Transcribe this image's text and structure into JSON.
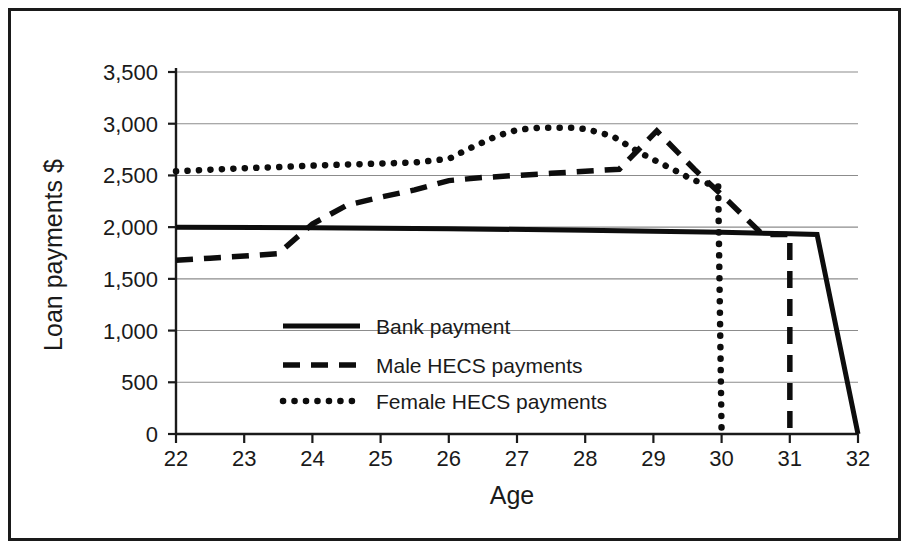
{
  "chart_data": {
    "type": "line",
    "title": "",
    "xlabel": "Age",
    "ylabel": "Loan payments $",
    "xlim": [
      22,
      32
    ],
    "ylim": [
      0,
      3500
    ],
    "ytick_labels": [
      "3,500",
      "3,000",
      "2,500",
      "2,000",
      "1,500",
      "1,000",
      "500",
      "0"
    ],
    "ytick_values": [
      3500,
      3000,
      2500,
      2000,
      1500,
      1000,
      500,
      0
    ],
    "xtick_labels": [
      "22",
      "23",
      "24",
      "25",
      "26",
      "27",
      "28",
      "29",
      "30",
      "31",
      "32"
    ],
    "xtick_values": [
      22,
      23,
      24,
      25,
      26,
      27,
      28,
      29,
      30,
      31,
      32
    ],
    "grid": true,
    "legend_position": "center-left-inside",
    "series": [
      {
        "name": "Bank payment",
        "style": "solid",
        "color": "#0d0d0d",
        "x": [
          22,
          24,
          26,
          28,
          29,
          30,
          31,
          31.4,
          32
        ],
        "values": [
          2000,
          1995,
          1985,
          1970,
          1960,
          1950,
          1935,
          1930,
          0
        ]
      },
      {
        "name": "Male HECS payments",
        "style": "dashed",
        "color": "#0d0d0d",
        "x": [
          22,
          22.5,
          23,
          23.5,
          24,
          24.5,
          25,
          25.5,
          26,
          26.5,
          27,
          27.5,
          28,
          28.5,
          29.05,
          29.6,
          30.1,
          30.6,
          31,
          31.001
        ],
        "values": [
          1680,
          1700,
          1720,
          1745,
          2030,
          2210,
          2290,
          2360,
          2450,
          2480,
          2500,
          2520,
          2540,
          2560,
          2930,
          2560,
          2250,
          1930,
          1930,
          0
        ]
      },
      {
        "name": "Female HECS payments",
        "style": "dotted",
        "color": "#0d0d0d",
        "x": [
          22,
          22.5,
          23,
          23.5,
          24,
          24.5,
          25,
          25.5,
          26,
          26.3,
          26.7,
          27,
          27.3,
          27.8,
          28,
          28.4,
          28.8,
          29.1,
          29.4,
          29.6,
          29.95,
          30
        ],
        "values": [
          2540,
          2555,
          2570,
          2580,
          2595,
          2605,
          2615,
          2625,
          2660,
          2760,
          2880,
          2940,
          2960,
          2960,
          2950,
          2880,
          2720,
          2620,
          2520,
          2450,
          2400,
          0
        ]
      }
    ]
  },
  "legend": {
    "entries": [
      {
        "label": "Bank payment",
        "style": "solid"
      },
      {
        "label": "Male HECS payments",
        "style": "dashed"
      },
      {
        "label": "Female HECS payments",
        "style": "dotted"
      }
    ]
  }
}
